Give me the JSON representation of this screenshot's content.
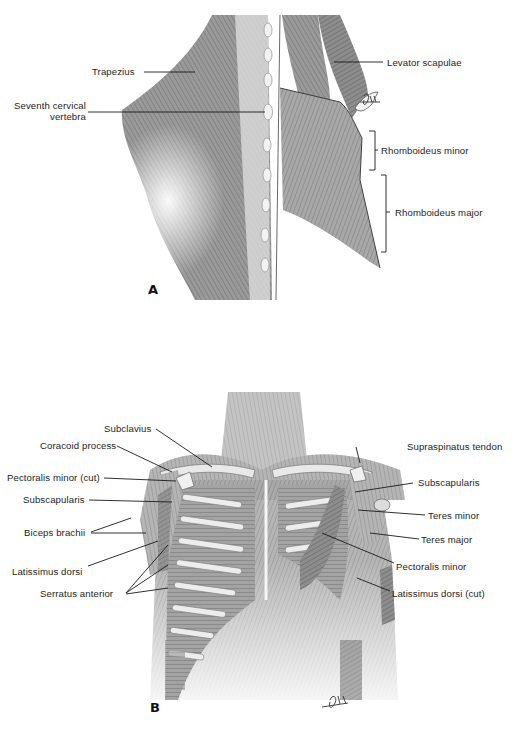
{
  "figure": {
    "panels": [
      {
        "id": "A",
        "letter": "A",
        "view": "Posterior view of upper back muscles",
        "labels": {
          "trapezius": "Trapezius",
          "seventh_cervical_line1": "Seventh cervical",
          "seventh_cervical_line2": "vertebra",
          "levator_scapulae": "Levator scapulae",
          "rhomboideus_minor": "Rhomboideus minor",
          "rhomboideus_major": "Rhomboideus major"
        },
        "signature": "artist-signature"
      },
      {
        "id": "B",
        "letter": "B",
        "view": "Anterior view of thorax and shoulder muscles",
        "labels": {
          "subclavius": "Subclavius",
          "coracoid_process": "Coracoid process",
          "pectoralis_minor_cut": "Pectoralis minor (cut)",
          "subscapularis_left": "Subscapularis",
          "biceps_brachii": "Biceps brachii",
          "latissimus_dorsi": "Latissimus dorsi",
          "serratus_anterior": "Serratus anterior",
          "supraspinatus_tendon": "Supraspinatus tendon",
          "subscapularis_right": "Subscapularis",
          "teres_minor": "Teres minor",
          "teres_major": "Teres major",
          "pectoralis_minor": "Pectoralis minor",
          "latissimus_dorsi_cut": "Latissimus dorsi (cut)"
        },
        "signature": "artist-signature"
      }
    ],
    "colors": {
      "muscle_dark": "#6e6e6e",
      "muscle_mid": "#9a9a9a",
      "muscle_light": "#c9c9c9",
      "bone": "#e6e6e6",
      "ink": "#1a1a1a"
    }
  }
}
